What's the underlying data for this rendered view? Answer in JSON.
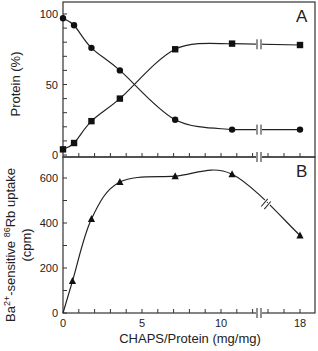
{
  "chart_data": [
    {
      "panel": "A",
      "type": "line",
      "title": "",
      "panel_label": "A",
      "xlabel": "CHAPS/Protein (mg/mg)",
      "ylabel": "Protein (%)",
      "xlim": [
        0,
        18
      ],
      "ylim": [
        0,
        100
      ],
      "y_ticks": [
        0,
        50,
        100
      ],
      "y_tick_labels": [
        "0",
        "50",
        "100"
      ],
      "axis_break_x": [
        12,
        16
      ],
      "series": [
        {
          "name": "circles",
          "marker": "circle",
          "x": [
            0,
            0.7,
            1.8,
            3.6,
            7.1,
            10.7,
            18
          ],
          "y": [
            97,
            92,
            76,
            60,
            25,
            18,
            18
          ]
        },
        {
          "name": "squares",
          "marker": "square",
          "x": [
            0,
            0.7,
            1.8,
            3.6,
            7.1,
            10.7,
            18
          ],
          "y": [
            4,
            8.5,
            24,
            40,
            75,
            79,
            78
          ]
        }
      ]
    },
    {
      "panel": "B",
      "type": "line",
      "title": "",
      "panel_label": "B",
      "xlabel": "CHAPS/Protein (mg/mg)",
      "ylabel_line1": "Ba",
      "ylabel_sup1": "2+",
      "ylabel_mid": "-sensitive ",
      "ylabel_sup2": "86",
      "ylabel_end": "Rb uptake",
      "ylabel_line2": "(cpm)",
      "xlim": [
        0,
        18
      ],
      "ylim": [
        0,
        650
      ],
      "x_ticks": [
        0,
        5,
        10,
        18
      ],
      "x_tick_labels": [
        "0",
        "5",
        "10",
        "18"
      ],
      "y_ticks": [
        0,
        200,
        400,
        600
      ],
      "y_tick_labels": [
        "0",
        "200",
        "400",
        "600"
      ],
      "axis_break_x": [
        12,
        16
      ],
      "series": [
        {
          "name": "triangles",
          "marker": "triangle",
          "x": [
            0,
            0.6,
            1.8,
            3.6,
            7.1,
            10.7,
            18
          ],
          "y": [
            0,
            142,
            418,
            582,
            608,
            617,
            345
          ]
        }
      ]
    }
  ]
}
